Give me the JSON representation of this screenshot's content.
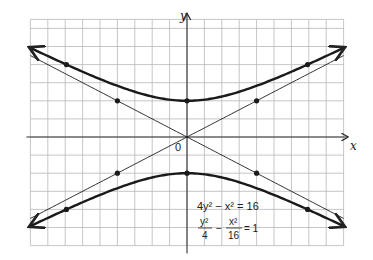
{
  "chart_data": {
    "type": "line",
    "title": "",
    "xlabel": "x",
    "ylabel": "y",
    "origin_label": "0",
    "xlim": [
      -9,
      9
    ],
    "ylim": [
      -6,
      6
    ],
    "grid": true,
    "grid_step": 1,
    "equations": {
      "standard": "4y² − x² = 16",
      "normalized_lhs_num1": "y²",
      "normalized_lhs_den1": "4",
      "normalized_minus": "−",
      "normalized_lhs_num2": "x²",
      "normalized_lhs_den2": "16",
      "normalized_rhs": "= 1"
    },
    "series": [
      {
        "name": "hyperbola upper branch",
        "style": "thick",
        "equation": "y = sqrt(4 + x^2/4)",
        "x_range": [
          -9,
          9
        ],
        "arrows": "both"
      },
      {
        "name": "hyperbola lower branch",
        "style": "thick",
        "equation": "y = -sqrt(4 + x^2/4)",
        "x_range": [
          -9,
          9
        ],
        "arrows": "both"
      },
      {
        "name": "asymptote y = x/2",
        "style": "thin",
        "equation": "y = x/2",
        "x_range": [
          -9,
          9
        ]
      },
      {
        "name": "asymptote y = -x/2",
        "style": "thin",
        "equation": "y = -x/2",
        "x_range": [
          -9,
          9
        ]
      }
    ],
    "points": [
      {
        "x": 0,
        "y": 2,
        "on": "vertex"
      },
      {
        "x": 0,
        "y": -2,
        "on": "vertex"
      },
      {
        "x": -6.93,
        "y": 4,
        "on": "hyperbola"
      },
      {
        "x": 6.93,
        "y": 4,
        "on": "hyperbola"
      },
      {
        "x": -6.93,
        "y": -4,
        "on": "hyperbola"
      },
      {
        "x": 6.93,
        "y": -4,
        "on": "hyperbola"
      },
      {
        "x": -4,
        "y": 2,
        "on": "asymptote"
      },
      {
        "x": 4,
        "y": 2,
        "on": "asymptote"
      },
      {
        "x": -4,
        "y": -2,
        "on": "asymptote"
      },
      {
        "x": 4,
        "y": -2,
        "on": "asymptote"
      }
    ]
  }
}
